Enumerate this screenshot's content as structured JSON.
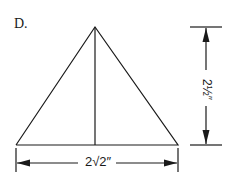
{
  "figure": {
    "part_label": "D.",
    "shape": "isosceles-triangle",
    "base_dimension": "2√2″",
    "height_dimension": "2½″",
    "stroke_color": "#1a1a1a",
    "background": "#ffffff"
  }
}
